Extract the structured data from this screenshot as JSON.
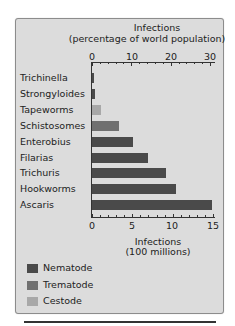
{
  "chart_data": {
    "type": "bar",
    "orientation": "horizontal",
    "title": "",
    "top_axis": {
      "label_line1": "Infections",
      "label_line2": "(percentage of world population)",
      "ticks": [
        "0",
        "10",
        "20",
        "30"
      ],
      "range": [
        0,
        31
      ]
    },
    "bottom_axis": {
      "label_line1": "Infections",
      "label_line2": "(100 millions)",
      "ticks": [
        "0",
        "5",
        "10",
        "15"
      ],
      "range": [
        0,
        15.5
      ]
    },
    "categories": [
      "Trichinella",
      "Strongyloides",
      "Tapeworms",
      "Schistosomes",
      "Enterobius",
      "Filarias",
      "Trichuris",
      "Hookworms",
      "Ascaris"
    ],
    "values": [
      0.3,
      0.4,
      1.1,
      3.3,
      5.1,
      7.0,
      9.2,
      10.4,
      14.9
    ],
    "groups": [
      "Nematode",
      "Nematode",
      "Cestode",
      "Trematode",
      "Nematode",
      "Nematode",
      "Nematode",
      "Nematode",
      "Nematode"
    ],
    "xlabel": "Infections (100 millions)",
    "ylabel": "",
    "grid": false,
    "legend": {
      "position": "bottom-left",
      "entries": [
        {
          "name": "Nematode",
          "color": "#4a4a4a"
        },
        {
          "name": "Trematode",
          "color": "#707070"
        },
        {
          "name": "Cestode",
          "color": "#a8a8a8"
        }
      ]
    }
  }
}
